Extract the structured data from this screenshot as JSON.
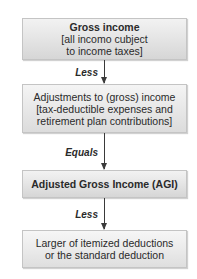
{
  "diagram": {
    "type": "flowchart",
    "boxes": [
      {
        "title": "Gross income",
        "lines": [
          "[all incomo cubject",
          "to income taxes]"
        ]
      },
      {
        "title": "",
        "lines": [
          "Adjustments to (gross) income",
          "[tax-deductible expenses and",
          "retirement plan contributions]"
        ]
      },
      {
        "title": "Adjusted Gross Income (AGI)",
        "lines": []
      },
      {
        "title": "",
        "lines": [
          "Larger of itemized deductions",
          "or the standard deduction"
        ]
      }
    ],
    "connectors": [
      {
        "label": "Less"
      },
      {
        "label": "Equals"
      },
      {
        "label": "Less"
      }
    ],
    "colors": {
      "box_fill_top": "#f2f2f2",
      "box_fill_bottom": "#d6d6d6",
      "box_border": "#c4c4c4",
      "arrow": "#3a3a3a",
      "text": "#2a2a2a"
    }
  }
}
